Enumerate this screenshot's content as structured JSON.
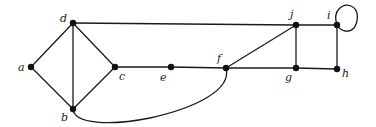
{
  "diagram": {
    "type": "undirected-graph",
    "nodes": [
      {
        "id": "a",
        "label": "a",
        "x": 31,
        "y": 67
      },
      {
        "id": "b",
        "label": "b",
        "x": 73,
        "y": 109
      },
      {
        "id": "c",
        "label": "c",
        "x": 115,
        "y": 67
      },
      {
        "id": "d",
        "label": "d",
        "x": 73,
        "y": 23
      },
      {
        "id": "e",
        "label": "e",
        "x": 171,
        "y": 67
      },
      {
        "id": "f",
        "label": "f",
        "x": 226,
        "y": 68
      },
      {
        "id": "g",
        "label": "g",
        "x": 296,
        "y": 68
      },
      {
        "id": "h",
        "label": "h",
        "x": 337,
        "y": 69
      },
      {
        "id": "i",
        "label": "i",
        "x": 337,
        "y": 25
      },
      {
        "id": "j",
        "label": "j",
        "x": 296,
        "y": 25
      }
    ],
    "edges": [
      [
        "a",
        "d"
      ],
      [
        "a",
        "b"
      ],
      [
        "d",
        "b"
      ],
      [
        "d",
        "c"
      ],
      [
        "b",
        "c"
      ],
      [
        "d",
        "j"
      ],
      [
        "c",
        "e"
      ],
      [
        "e",
        "f"
      ],
      [
        "f",
        "g"
      ],
      [
        "f",
        "j"
      ],
      [
        "j",
        "g"
      ],
      [
        "j",
        "i"
      ],
      [
        "g",
        "h"
      ],
      [
        "i",
        "h"
      ],
      [
        "b",
        "f"
      ],
      [
        "i",
        "i"
      ]
    ]
  }
}
